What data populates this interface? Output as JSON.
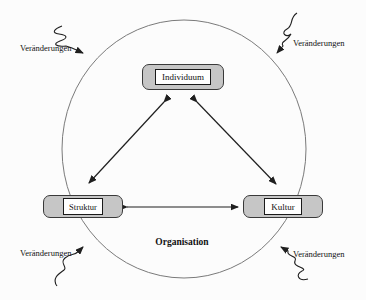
{
  "diagram": {
    "type": "organisational-model-diagram",
    "center_label": "Organisation",
    "nodes": {
      "individuum": {
        "label": "Individuum"
      },
      "struktur": {
        "label": "Struktur"
      },
      "kultur": {
        "label": "Kultur"
      }
    },
    "external_labels": {
      "top_left": "Veränderungen",
      "top_right": "Veränderungen",
      "bottom_left": "Veränderungen",
      "bottom_right": "Veränderungen"
    },
    "relations": [
      "Individuum ↔ Struktur",
      "Individuum ↔ Kultur",
      "Struktur ↔ Kultur"
    ],
    "icons": [
      "squiggle-arrow-top-left",
      "squiggle-arrow-top-right",
      "squiggle-arrow-bottom-left",
      "squiggle-arrow-bottom-right"
    ],
    "colors": {
      "node_fill": "#c6c6c6",
      "node_border": "#3a3a3a",
      "inner_fill": "#ffffff",
      "line": "#1f1f1f",
      "circle_stroke": "#7a7a7a",
      "background": "#fcfcfc"
    }
  }
}
